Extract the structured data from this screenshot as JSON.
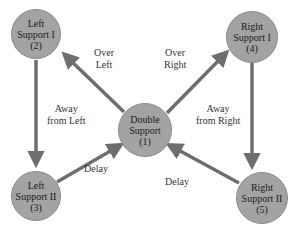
{
  "diagram": {
    "type": "state-transition",
    "colors": {
      "node_fill": "#a3a3a3",
      "edge": "#6e6e6e",
      "text": "#1a1a1a"
    },
    "nodes": [
      {
        "id": "double",
        "line1": "Double",
        "line2": "Support",
        "num": "(1)"
      },
      {
        "id": "left1",
        "line1": "Left",
        "line2": "Support I",
        "num": "(2)"
      },
      {
        "id": "left2",
        "line1": "Left",
        "line2": "Support II",
        "num": "(3)"
      },
      {
        "id": "right1",
        "line1": "Right",
        "line2": "Support I",
        "num": "(4)"
      },
      {
        "id": "right2",
        "line1": "Right",
        "line2": "Support II",
        "num": "(5)"
      }
    ],
    "edges": [
      {
        "from": "double",
        "to": "left1",
        "line1": "Over",
        "line2": "Left"
      },
      {
        "from": "double",
        "to": "right1",
        "line1": "Over",
        "line2": "Right"
      },
      {
        "from": "left1",
        "to": "left2",
        "line1": "Away",
        "line2": "from Left"
      },
      {
        "from": "right1",
        "to": "right2",
        "line1": "Away",
        "line2": "from Right"
      },
      {
        "from": "left2",
        "to": "double",
        "line1": "Delay"
      },
      {
        "from": "right2",
        "to": "double",
        "line1": "Delay"
      }
    ]
  }
}
